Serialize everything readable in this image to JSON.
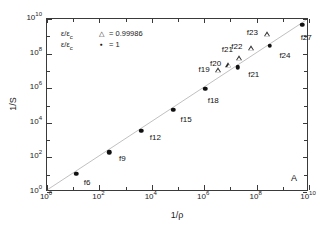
{
  "figure": {
    "panel_label": "A"
  },
  "axes": {
    "xlabel": "1/ρ",
    "ylabel": "1/S",
    "x_ticks": [
      {
        "label": "10",
        "exp": "0",
        "value": 0
      },
      {
        "label": "10",
        "exp": "2",
        "value": 2
      },
      {
        "label": "10",
        "exp": "4",
        "value": 4
      },
      {
        "label": "10",
        "exp": "6",
        "value": 6
      },
      {
        "label": "10",
        "exp": "8",
        "value": 8
      },
      {
        "label": "10",
        "exp": "10",
        "value": 10
      }
    ],
    "y_ticks": [
      {
        "label": "10",
        "exp": "0",
        "value": 0
      },
      {
        "label": "10",
        "exp": "2",
        "value": 2
      },
      {
        "label": "10",
        "exp": "4",
        "value": 4
      },
      {
        "label": "10",
        "exp": "6",
        "value": 6
      },
      {
        "label": "10",
        "exp": "8",
        "value": 8
      },
      {
        "label": "10",
        "exp": "10",
        "value": 10
      }
    ]
  },
  "legend": {
    "entries": [
      {
        "symbol_text": "ε/ε",
        "symbol_sub": "c",
        "marker": "triangle-open",
        "marker_glyph": "△",
        "equals": "=",
        "value": "0.99986"
      },
      {
        "symbol_text": "ε/ε",
        "symbol_sub": "c",
        "marker": "circle-filled",
        "marker_glyph": "●",
        "equals": "=",
        "value": "1"
      }
    ]
  },
  "chart_data": {
    "type": "scatter",
    "title": "",
    "xlabel": "1/ρ",
    "ylabel": "1/S",
    "xscale": "log",
    "yscale": "log",
    "xlim": [
      1,
      10000000000
    ],
    "ylim": [
      1,
      10000000000
    ],
    "grid": false,
    "legend_position": "upper-left",
    "series": [
      {
        "name": "ε/ε_c = 1",
        "marker": "circle-filled",
        "points": [
          {
            "label": "f6",
            "x": 13.0,
            "y": 11.0,
            "log_x": 1.11,
            "log_y": 1.05,
            "label_dx": 11,
            "label_dy": 9
          },
          {
            "label": "f9",
            "x": 240.0,
            "y": 200.0,
            "log_x": 2.38,
            "log_y": 2.3,
            "label_dx": 13,
            "label_dy": 7
          },
          {
            "label": "f12",
            "x": 4000.0,
            "y": 3400.0,
            "log_x": 3.6,
            "log_y": 3.53,
            "label_dx": 14,
            "label_dy": 7
          },
          {
            "label": "f15",
            "x": 65000.0,
            "y": 55000.0,
            "log_x": 4.81,
            "log_y": 4.74,
            "label_dx": 13,
            "label_dy": 10
          },
          {
            "label": "f18",
            "x": 1100000.0,
            "y": 950000.0,
            "log_x": 6.04,
            "log_y": 5.98,
            "label_dx": 8,
            "label_dy": 12
          },
          {
            "label": "f21",
            "x": 19000000.0,
            "y": 16000000.0,
            "log_x": 7.28,
            "log_y": 7.2,
            "label_dx": 16,
            "label_dy": 8
          },
          {
            "label": "f24",
            "x": 320000000.0,
            "y": 280000000.0,
            "log_x": 8.51,
            "log_y": 8.45,
            "label_dx": 15,
            "label_dy": 10
          },
          {
            "label": "f27",
            "x": 5500000000.0,
            "y": 4800000000.0,
            "log_x": 9.74,
            "log_y": 9.68,
            "label_dx": 4,
            "label_dy": 13
          }
        ]
      },
      {
        "name": "ε/ε_c = 0.99986",
        "marker": "triangle-open",
        "points": [
          {
            "label": "f19",
            "x": 3400000.0,
            "y": 11000000.0,
            "log_x": 6.53,
            "log_y": 7.05,
            "label_dx": -14,
            "label_dy": 0
          },
          {
            "label": "f20",
            "x": 8500000.0,
            "y": 22000000.0,
            "log_x": 6.93,
            "log_y": 7.34,
            "label_dx": -13,
            "label_dy": -1
          },
          {
            "label": "f21",
            "x": 22000000.0,
            "y": 55000000.0,
            "log_x": 7.34,
            "log_y": 7.74,
            "label_dx": -12,
            "label_dy": -8
          },
          {
            "label": "f22",
            "x": 60000000.0,
            "y": 210000000.0,
            "log_x": 7.78,
            "log_y": 8.32,
            "label_dx": -14,
            "label_dy": -1
          },
          {
            "label": "f23",
            "x": 260000000.0,
            "y": 1300000000.0,
            "log_x": 8.41,
            "log_y": 9.11,
            "label_dx": -15,
            "label_dy": -1
          }
        ]
      }
    ],
    "guide_line": {
      "style": "solid-thin-gray",
      "from": {
        "log_x": 0.0,
        "log_y": 0.0
      },
      "to": {
        "log_x": 9.95,
        "log_y": 9.92
      }
    }
  }
}
